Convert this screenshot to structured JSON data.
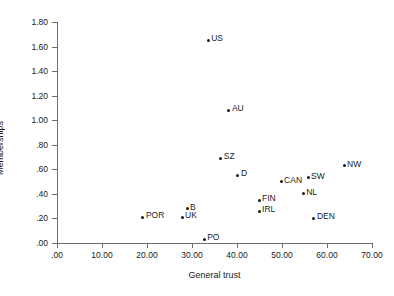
{
  "chart_data": {
    "type": "scatter",
    "title": "",
    "xlabel": "General trust",
    "ylabel": "Memberships",
    "xlim": [
      0,
      70
    ],
    "ylim": [
      0,
      1.8
    ],
    "grid": false,
    "legend": false,
    "x_ticks": [
      ".00",
      "10.00",
      "20.00",
      "30.00",
      "40.00",
      "50.00",
      "60.00",
      "70.00"
    ],
    "x_tick_values": [
      0,
      10,
      20,
      30,
      40,
      50,
      60,
      70
    ],
    "y_ticks": [
      ".00",
      ".20",
      ".40",
      ".60",
      ".80",
      "1.00",
      "1.20",
      "1.40",
      "1.60",
      "1.80"
    ],
    "y_tick_values": [
      0,
      0.2,
      0.4,
      0.6,
      0.8,
      1.0,
      1.2,
      1.4,
      1.6,
      1.8
    ],
    "points": [
      {
        "label": "US",
        "x": 33.6,
        "y": 1.65
      },
      {
        "label": "AU",
        "x": 38.2,
        "y": 1.08
      },
      {
        "label": "SZ",
        "x": 36.4,
        "y": 0.69
      },
      {
        "label": "D",
        "x": 40.2,
        "y": 0.55
      },
      {
        "label": "NW",
        "x": 63.8,
        "y": 0.63
      },
      {
        "label": "SW",
        "x": 55.8,
        "y": 0.53
      },
      {
        "label": "CAN",
        "x": 49.8,
        "y": 0.5
      },
      {
        "label": "NL",
        "x": 54.7,
        "y": 0.4
      },
      {
        "label": "FIN",
        "x": 44.9,
        "y": 0.35
      },
      {
        "label": "IRL",
        "x": 44.9,
        "y": 0.26
      },
      {
        "label": "DEN",
        "x": 57.1,
        "y": 0.2
      },
      {
        "label": "B",
        "x": 28.9,
        "y": 0.28
      },
      {
        "label": "UK",
        "x": 27.8,
        "y": 0.21
      },
      {
        "label": "POR",
        "x": 19.1,
        "y": 0.21
      },
      {
        "label": "PO",
        "x": 32.7,
        "y": 0.03
      }
    ],
    "colors": {
      "marker": "#1a1a1a",
      "axis": "#6d6d6d",
      "text": "#1a1a1a",
      "background": "#ffffff"
    }
  }
}
